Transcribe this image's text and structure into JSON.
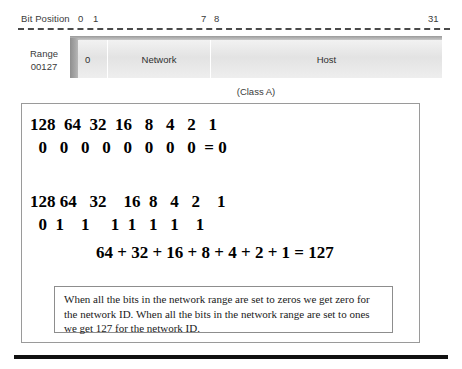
{
  "ruler": {
    "label": "Bit Position",
    "ticks": [
      {
        "name": "tick-0",
        "value": "0"
      },
      {
        "name": "tick-1",
        "value": "1"
      },
      {
        "name": "tick-7",
        "value": "7"
      },
      {
        "name": "tick-8",
        "value": "8"
      },
      {
        "name": "tick-31",
        "value": "31"
      }
    ]
  },
  "range_label": {
    "line1": "Range",
    "line2": "00127"
  },
  "bar": {
    "segments": [
      {
        "name": "bit-segment",
        "label": "0"
      },
      {
        "name": "network-segment",
        "label": "Network"
      },
      {
        "name": "host-segment",
        "label": "Host"
      }
    ]
  },
  "class_caption": "(Class A)",
  "calculations": {
    "block_a": {
      "weights": "128  64  32  16   8   4   2   1",
      "bits": "  0   0   0   0   0   0   0   0  = 0"
    },
    "block_b": {
      "weights": "128 64   32    16  8   4   2    1",
      "bits": "  0  1    1     1  1   1   1    1",
      "sum": "64 + 32 + 16 + 8 + 4 + 2 + 1 = 127"
    }
  },
  "note": "When all the bits in the network range are set to zeros we get zero for the network ID.  When all the bits in the network range are set to ones we get 127 for the network ID."
}
